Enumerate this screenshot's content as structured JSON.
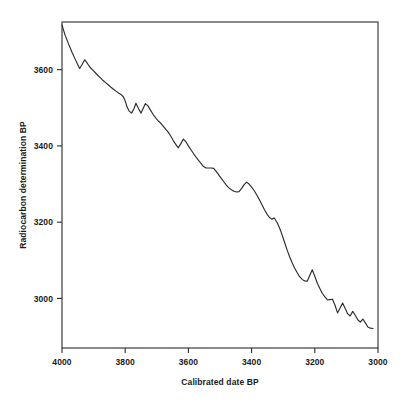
{
  "chart_data": {
    "type": "line",
    "title": "",
    "xlabel": "Calibrated date BP",
    "ylabel": "Radiocarbon determination BP",
    "xlim": [
      4000,
      3000
    ],
    "ylim": [
      2870,
      3725
    ],
    "x_reversed": true,
    "grid": false,
    "legend": null,
    "xticks": [
      4000,
      3800,
      3600,
      3400,
      3200,
      3000
    ],
    "xtick_labels": [
      "4000",
      "3800",
      "3600",
      "3400",
      "3200",
      "3000"
    ],
    "yticks": [
      3600,
      3400,
      3200,
      3000
    ],
    "ytick_labels": [
      "3600",
      "3400",
      "3200",
      "3000"
    ],
    "series": [
      {
        "name": "Calibration curve",
        "color": "#2b2b2b",
        "x": [
          4000,
          3990,
          3978,
          3968,
          3958,
          3950,
          3944,
          3936,
          3928,
          3922,
          3912,
          3900,
          3890,
          3880,
          3872,
          3862,
          3852,
          3844,
          3836,
          3828,
          3820,
          3812,
          3806,
          3800,
          3794,
          3788,
          3780,
          3772,
          3766,
          3758,
          3750,
          3744,
          3736,
          3728,
          3720,
          3712,
          3704,
          3696,
          3688,
          3680,
          3672,
          3664,
          3656,
          3648,
          3640,
          3632,
          3624,
          3616,
          3608,
          3600,
          3592,
          3584,
          3576,
          3568,
          3560,
          3552,
          3544,
          3536,
          3528,
          3520,
          3512,
          3504,
          3496,
          3488,
          3480,
          3472,
          3464,
          3456,
          3448,
          3440,
          3432,
          3424,
          3416,
          3408,
          3400,
          3392,
          3384,
          3376,
          3368,
          3360,
          3352,
          3344,
          3336,
          3328,
          3320,
          3312,
          3304,
          3296,
          3288,
          3280,
          3272,
          3264,
          3256,
          3248,
          3240,
          3232,
          3224,
          3216,
          3208,
          3200,
          3192,
          3184,
          3176,
          3168,
          3160,
          3152,
          3144,
          3136,
          3128,
          3120,
          3112,
          3104,
          3096,
          3088,
          3080,
          3072,
          3064,
          3056,
          3048,
          3040,
          3032,
          3024,
          3016
        ],
        "y": [
          3717,
          3690,
          3665,
          3645,
          3627,
          3613,
          3603,
          3614,
          3626,
          3619,
          3607,
          3597,
          3588,
          3580,
          3573,
          3566,
          3559,
          3553,
          3548,
          3543,
          3538,
          3534,
          3529,
          3518,
          3502,
          3492,
          3486,
          3498,
          3512,
          3498,
          3486,
          3497,
          3511,
          3505,
          3494,
          3483,
          3474,
          3466,
          3460,
          3452,
          3444,
          3436,
          3426,
          3414,
          3404,
          3395,
          3406,
          3418,
          3411,
          3400,
          3390,
          3380,
          3371,
          3362,
          3354,
          3346,
          3342,
          3342,
          3342,
          3341,
          3333,
          3324,
          3315,
          3306,
          3297,
          3290,
          3285,
          3281,
          3279,
          3280,
          3288,
          3298,
          3305,
          3300,
          3292,
          3283,
          3272,
          3260,
          3247,
          3234,
          3222,
          3213,
          3208,
          3211,
          3200,
          3186,
          3168,
          3148,
          3128,
          3110,
          3094,
          3080,
          3068,
          3057,
          3050,
          3046,
          3045,
          3060,
          3075,
          3058,
          3040,
          3026,
          3013,
          3004,
          2996,
          2997,
          2998,
          2982,
          2962,
          2975,
          2988,
          2974,
          2960,
          2954,
          2966,
          2956,
          2944,
          2938,
          2946,
          2936,
          2925,
          2922,
          2921
        ]
      }
    ]
  },
  "axes": {
    "x_title": "Calibrated date BP",
    "y_title": "Radiocarbon determination BP"
  }
}
